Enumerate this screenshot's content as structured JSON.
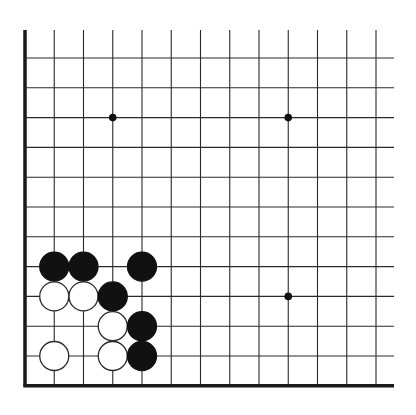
{
  "board": {
    "title": "Go problem diagram",
    "columns": 13,
    "rows": 12,
    "origin_x": 25,
    "origin_y": 58,
    "spacing_x": 29.25,
    "spacing_y": 29.8,
    "line_top": 30,
    "line_right": 394,
    "edges": [
      "left",
      "bottom"
    ],
    "line_color": "#2a2a2a",
    "edge_color": "#1a1a1a",
    "stone_radius": 14.5,
    "star_points": [
      {
        "col": 3,
        "row": 2
      },
      {
        "col": 9,
        "row": 2
      },
      {
        "col": 9,
        "row": 8
      }
    ],
    "stones": [
      {
        "color": "black",
        "col": 1,
        "row": 7
      },
      {
        "color": "black",
        "col": 2,
        "row": 7
      },
      {
        "color": "black",
        "col": 4,
        "row": 7
      },
      {
        "color": "white",
        "col": 1,
        "row": 8
      },
      {
        "color": "white",
        "col": 2,
        "row": 8
      },
      {
        "color": "black",
        "col": 3,
        "row": 8
      },
      {
        "color": "white",
        "col": 3,
        "row": 9
      },
      {
        "color": "black",
        "col": 4,
        "row": 9
      },
      {
        "color": "white",
        "col": 1,
        "row": 10
      },
      {
        "color": "white",
        "col": 3,
        "row": 10
      },
      {
        "color": "black",
        "col": 4,
        "row": 10
      }
    ]
  }
}
